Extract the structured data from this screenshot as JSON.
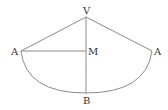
{
  "diagram": {
    "title": "",
    "points": {
      "V": {
        "label": "V"
      },
      "A_left": {
        "label": "A"
      },
      "A_right": {
        "label": "A"
      },
      "M": {
        "label": "M"
      },
      "B": {
        "label": "B"
      }
    },
    "segments": [
      {
        "from": "V",
        "to": "A_left"
      },
      {
        "from": "V",
        "to": "A_right"
      },
      {
        "from": "A_left",
        "to": "M"
      },
      {
        "from": "V",
        "to": "B"
      }
    ],
    "arcs": [
      {
        "from": "A_left",
        "to": "A_right",
        "through": "B"
      }
    ],
    "colors": {
      "line": "#8a8a8a",
      "text": "#333333"
    }
  }
}
